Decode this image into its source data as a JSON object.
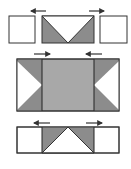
{
  "diagram": {
    "colors": {
      "outline": "#333333",
      "dark_fill": "#8c8c8c",
      "light_fill": "#a8a8a8",
      "white": "#ffffff"
    },
    "stages": [
      {
        "name": "top",
        "arrows": [
          "left",
          "right"
        ],
        "parts": [
          "left-square",
          "center-rect-with-v-cut",
          "right-square"
        ]
      },
      {
        "name": "middle",
        "arrows": [
          "right",
          "left"
        ],
        "parts": [
          "left-panel-with-notch",
          "center-panel",
          "right-panel-with-notch"
        ]
      },
      {
        "name": "bottom",
        "arrows": [
          "left",
          "right"
        ],
        "parts": [
          "left-square",
          "center-rect-with-peak-cut",
          "right-square"
        ]
      }
    ]
  }
}
